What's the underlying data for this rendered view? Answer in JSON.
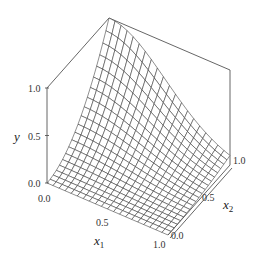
{
  "chart_data": {
    "type": "surface",
    "title": "",
    "xlabel": "x1",
    "zlabel": "x2",
    "ylabel": "y",
    "x1_range": [
      0.0,
      1.0
    ],
    "x2_range": [
      0.0,
      1.0
    ],
    "y_range": [
      0.0,
      1.0
    ],
    "x1_ticks": [
      "0.0",
      "0.5",
      "1.0"
    ],
    "x2_ticks": [
      "0.0",
      "0.5",
      "1.0"
    ],
    "y_ticks": [
      "0.0",
      "0.5",
      "1.0"
    ],
    "grid_resolution": 20,
    "surface_description": "Wireframe surface rising to y=1.0 at x1=0, x2=1 and decaying toward 0 as x1 increases or x2 decreases; approx y = x2^2 * exp(-2.3 * x1^2)",
    "sample_points": [
      {
        "x1": 0.0,
        "x2": 0.0,
        "y": 0.0
      },
      {
        "x1": 0.0,
        "x2": 0.5,
        "y": 0.25
      },
      {
        "x1": 0.0,
        "x2": 1.0,
        "y": 1.0
      },
      {
        "x1": 0.5,
        "x2": 1.0,
        "y": 0.56
      },
      {
        "x1": 1.0,
        "x2": 1.0,
        "y": 0.1
      },
      {
        "x1": 1.0,
        "x2": 0.0,
        "y": 0.0
      },
      {
        "x1": 0.5,
        "x2": 0.5,
        "y": 0.14
      }
    ],
    "legend": null,
    "grid": false
  },
  "labels": {
    "y_axis": "y",
    "x1_axis": "x",
    "x1_sub": "1",
    "x2_axis": "x",
    "x2_sub": "2",
    "y_ticks": [
      "1.0",
      "0.5",
      "0.0"
    ],
    "x1_ticks": [
      "0.0",
      "0.5",
      "1.0"
    ],
    "x2_ticks": [
      "0.0",
      "0.5",
      "1.0"
    ]
  }
}
